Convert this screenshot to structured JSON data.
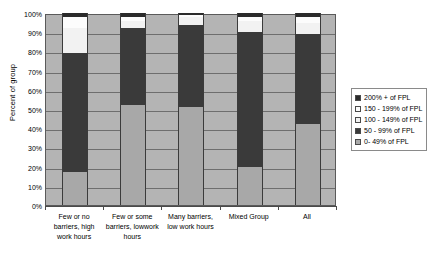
{
  "chart_data": {
    "type": "bar",
    "stacked": true,
    "title": "",
    "xlabel": "",
    "ylabel": "Percent of group",
    "ylim": [
      0,
      100
    ],
    "ytick_labels": [
      "100%",
      "90%",
      "80%",
      "70%",
      "60%",
      "50%",
      "40%",
      "30%",
      "20%",
      "10%",
      "0%"
    ],
    "ytick_values": [
      100,
      90,
      80,
      70,
      60,
      50,
      40,
      30,
      20,
      10,
      0
    ],
    "grid": true,
    "legend_position": "right",
    "categories": [
      "Few  or no barriers, high work hours",
      "Few  or some barriers, lowwork hours",
      "Many barriers, low work hours",
      "Mixed Group",
      "All"
    ],
    "category_lines": [
      [
        "Few  or no",
        "barriers, high",
        "work hours"
      ],
      [
        "Few  or some",
        "barriers, lowwork",
        "hours"
      ],
      [
        "Many barriers,",
        "low work hours"
      ],
      [
        "Mixed Group"
      ],
      [
        "All"
      ]
    ],
    "series": [
      {
        "name": "0- 49% of FPL",
        "color": "#a8a8a8",
        "values": [
          17,
          52,
          51,
          20,
          42
        ]
      },
      {
        "name": "50 - 99% of FPL",
        "color": "#3a3a3a",
        "values": [
          62,
          40,
          43,
          70,
          47
        ]
      },
      {
        "name": "100 - 149% of FPL",
        "color": "#f2f2f2",
        "values": [
          13,
          4,
          4,
          6,
          6
        ]
      },
      {
        "name": "150 - 199% of FPL",
        "color": "#fcfcfc",
        "values": [
          6,
          2,
          1,
          2,
          3
        ]
      },
      {
        "name": "200% + of FPL",
        "color": "#2b2b2b",
        "values": [
          2,
          2,
          1,
          2,
          2
        ]
      }
    ],
    "legend_entries": [
      {
        "label": "200% + of FPL",
        "swatch": "#2b2b2b"
      },
      {
        "label": "150 - 199% of FPL",
        "swatch": "#fcfcfc"
      },
      {
        "label": "100 - 149% of FPL",
        "swatch": "#f2f2f2"
      },
      {
        "label": "50 - 99% of FPL",
        "swatch": "#3a3a3a"
      },
      {
        "label": "0- 49% of FPL",
        "swatch": "#a8a8a8"
      }
    ],
    "plot_background": "#b4b4b4"
  }
}
